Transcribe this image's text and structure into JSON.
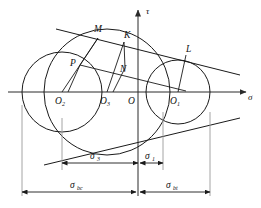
{
  "figure": {
    "background_color": "#ffffff",
    "stroke_color": "#1a1a1a",
    "extension_line_color": "#9a9a9a"
  },
  "axes": {
    "vertical": {
      "label": "τ",
      "name": "tau-axis"
    },
    "horizontal": {
      "label": "σ",
      "name": "sigma-axis"
    },
    "origin_label": "O"
  },
  "centers": [
    {
      "id": "O2",
      "base": "O",
      "sub": "2",
      "cx": 62,
      "cy": 92,
      "r": 40
    },
    {
      "id": "O3",
      "base": "O",
      "sub": "3",
      "cx": 107,
      "cy": 92,
      "r": 63
    },
    {
      "id": "O",
      "base": "O",
      "sub": "",
      "cx": 138,
      "cy": 92,
      "r": 0
    },
    {
      "id": "O1",
      "base": "O",
      "sub": "1",
      "cx": 178,
      "cy": 92,
      "r": 32
    }
  ],
  "points": [
    {
      "id": "M",
      "label": "M",
      "x": 98,
      "y": 38
    },
    {
      "id": "K",
      "label": "K",
      "x": 124,
      "y": 42
    },
    {
      "id": "L",
      "label": "L",
      "x": 186,
      "y": 55
    },
    {
      "id": "P",
      "label": "P",
      "x": 80,
      "y": 65
    },
    {
      "id": "N",
      "label": "N",
      "x": 125,
      "y": 68
    }
  ],
  "dimensions": [
    {
      "id": "sigma3",
      "base": "σ",
      "sub": "3",
      "label": "σ3",
      "from_x": 62,
      "to_x": 138,
      "y": 163,
      "row": 1
    },
    {
      "id": "sigma1",
      "base": "σ",
      "sub": "1",
      "label": "σ1",
      "from_x": 138,
      "to_x": 163,
      "y": 163,
      "row": 1
    },
    {
      "id": "sigma_bc",
      "base": "σ",
      "sub": "bc",
      "label": "σbc",
      "from_x": 22,
      "to_x": 138,
      "y": 192,
      "row": 2
    },
    {
      "id": "sigma_bt",
      "base": "σ",
      "sub": "bt",
      "label": "σbt",
      "from_x": 138,
      "to_x": 210,
      "y": 192,
      "row": 2
    }
  ],
  "extension_lines": [
    {
      "x": 22,
      "y1": 105,
      "y2": 196
    },
    {
      "x": 62,
      "y1": 115,
      "y2": 170
    },
    {
      "x": 163,
      "y1": 110,
      "y2": 170
    },
    {
      "x": 210,
      "y1": 110,
      "y2": 196
    }
  ],
  "envelopes": {
    "upper": {
      "x1": 56,
      "y1": 29,
      "x2": 240,
      "y2": 75
    },
    "lower": {
      "x1": 44,
      "y1": 165,
      "x2": 240,
      "y2": 118
    }
  },
  "construction_segments": [
    {
      "name": "O2-M-radius",
      "x1": 62,
      "y1": 92,
      "x2": 98,
      "y2": 38
    },
    {
      "name": "O3-K-radius",
      "x1": 107,
      "y1": 92,
      "x2": 124,
      "y2": 42
    },
    {
      "name": "O1-L-radius",
      "x1": 178,
      "y1": 92,
      "x2": 186,
      "y2": 55
    },
    {
      "name": "P-N-chord",
      "x1": 80,
      "y1": 65,
      "x2": 173,
      "y2": 88
    },
    {
      "name": "M-P-offset",
      "x1": 98,
      "y1": 38,
      "x2": 80,
      "y2": 65
    },
    {
      "name": "K-N-offset",
      "x1": 124,
      "y1": 42,
      "x2": 125,
      "y2": 68
    },
    {
      "name": "P-drop",
      "x1": 80,
      "y1": 65,
      "x2": 68,
      "y2": 92
    },
    {
      "name": "N-drop",
      "x1": 125,
      "y1": 68,
      "x2": 113,
      "y2": 92
    }
  ]
}
